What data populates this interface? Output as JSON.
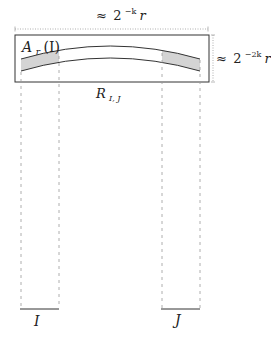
{
  "diagram": {
    "width_label": {
      "approx": "≈",
      "base": "2",
      "exp": "−k",
      "var": "r"
    },
    "height_label": {
      "approx": "≈",
      "base": "2",
      "exp": "−2k",
      "var": "r"
    },
    "region_label": {
      "main": "A",
      "sub": "r",
      "arg": "(I)"
    },
    "rect_label": {
      "main": "R",
      "sub": "I, J"
    },
    "interval_left": "I",
    "interval_right": "J",
    "colors": {
      "stroke": "#333333",
      "dashed": "#9a9a9a",
      "shade": "#d4d4d4",
      "background": "#ffffff"
    }
  }
}
